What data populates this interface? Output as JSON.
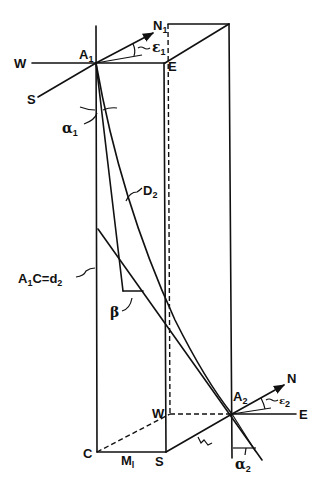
{
  "diagram": {
    "type": "geometric-3d-box-with-borehole-traces",
    "ink_color": "#111111",
    "background": "#ffffff",
    "labels": {
      "top_west": "W",
      "top_south": "S",
      "top_north": "N",
      "top_north_sub": "1",
      "top_east": "E",
      "point_a1": "A",
      "point_a1_sub": "1",
      "epsilon1": "ε",
      "epsilon1_sub": "1",
      "alpha1": "α",
      "alpha1_sub": "1",
      "curve_d2": "D",
      "curve_d2_sub": "2",
      "depth_eq_prefix": "A",
      "depth_eq_prefix_sub": "1",
      "depth_eq_rest": "C=d",
      "depth_eq_rest_sub": "2",
      "beta": "β",
      "bottom_c": "C",
      "bottom_m": "M",
      "bottom_m_sub": "l",
      "bottom_s": "S",
      "bottom_w": "W",
      "point_a2": "A",
      "point_a2_sub": "2",
      "bottom_north": "N",
      "bottom_east": "E",
      "epsilon2": "ε",
      "epsilon2_sub": "2",
      "alpha2": "α",
      "alpha2_sub": "2",
      "l_marker": "L",
      "l_marker_sub": "1"
    }
  }
}
